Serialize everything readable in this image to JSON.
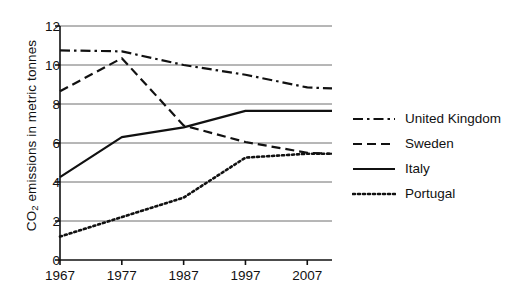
{
  "chart_data": {
    "type": "line",
    "title": "",
    "xlabel": "",
    "ylabel": "CO2 emissions in metric tonnes",
    "ylabel_prefix": "CO",
    "ylabel_sub": "2",
    "ylabel_suffix": " emissions in metric tonnes",
    "x": [
      1967,
      1977,
      1987,
      1997,
      2007
    ],
    "xtick_labels": [
      "1967",
      "1977",
      "1987",
      "1997",
      "2007"
    ],
    "ytick_labels": [
      "0",
      "2",
      "4",
      "6",
      "8",
      "10",
      "12"
    ],
    "ytick_values": [
      0,
      2,
      4,
      6,
      8,
      10,
      12
    ],
    "xlim": [
      1967,
      2011
    ],
    "ylim": [
      0,
      12
    ],
    "grid": "horizontal",
    "legend_position": "right",
    "series": [
      {
        "name": "United Kingdom",
        "style": "dash-dot",
        "color": "#111111",
        "values": [
          10.75,
          10.7,
          10.0,
          9.5,
          8.85
        ],
        "extend_x": 2011,
        "extend_value": 8.8
      },
      {
        "name": "Sweden",
        "style": "dashed",
        "color": "#111111",
        "values": [
          8.65,
          10.35,
          6.9,
          6.05,
          5.5
        ],
        "extend_x": 2011,
        "extend_value": 5.45
      },
      {
        "name": "Italy",
        "style": "solid",
        "color": "#111111",
        "values": [
          4.25,
          6.3,
          6.8,
          7.65,
          7.65
        ],
        "extend_x": 2011,
        "extend_value": 7.65
      },
      {
        "name": "Portugal",
        "style": "dotted",
        "color": "#111111",
        "values": [
          1.2,
          2.2,
          3.2,
          5.25,
          5.45
        ],
        "extend_x": 2011,
        "extend_value": 5.45
      }
    ]
  },
  "legend": {
    "items": [
      {
        "label": "United Kingdom",
        "style": "dash-dot"
      },
      {
        "label": "Sweden",
        "style": "dashed"
      },
      {
        "label": "Italy",
        "style": "solid"
      },
      {
        "label": "Portugal",
        "style": "dotted"
      }
    ]
  }
}
